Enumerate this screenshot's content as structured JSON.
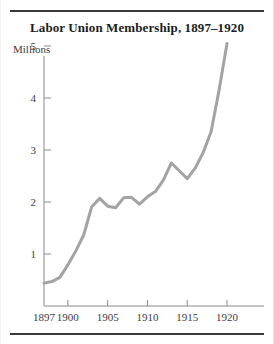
{
  "figure": {
    "title": "Labor Union Membership, 1897–1920",
    "ylabel": "Millions",
    "line_color": "#a3a3a3",
    "rule_color": "#3a3a3a",
    "text_color": "#3d3d3d",
    "background": "#ffffff"
  },
  "axis": {
    "y_ticks": [
      "1",
      "2",
      "3",
      "4",
      "5"
    ],
    "x_ticks": [
      "1897",
      "1900",
      "1905",
      "1910",
      "1915",
      "1920"
    ]
  },
  "chart_data": {
    "type": "line",
    "title": "Labor Union Membership, 1897–1920",
    "xlabel": "",
    "ylabel": "Millions",
    "xlim": [
      1897,
      1920
    ],
    "ylim": [
      0,
      5.3
    ],
    "grid": false,
    "legend": null,
    "x_tick_labels": [
      "1897",
      "1900",
      "1905",
      "1910",
      "1915",
      "1920"
    ],
    "y_tick_labels": [
      "1",
      "2",
      "3",
      "4",
      "5"
    ],
    "series": [
      {
        "name": "Labor union membership (millions)",
        "color": "#a3a3a3",
        "x": [
          1897,
          1898,
          1899,
          1900,
          1901,
          1902,
          1903,
          1904,
          1905,
          1906,
          1907,
          1908,
          1909,
          1910,
          1911,
          1912,
          1913,
          1914,
          1915,
          1916,
          1917,
          1918,
          1919,
          1920
        ],
        "values": [
          0.44,
          0.47,
          0.55,
          0.79,
          1.06,
          1.37,
          1.91,
          2.07,
          1.92,
          1.89,
          2.08,
          2.09,
          1.96,
          2.1,
          2.2,
          2.42,
          2.75,
          2.6,
          2.45,
          2.65,
          2.95,
          3.35,
          4.15,
          5.05
        ]
      }
    ]
  }
}
